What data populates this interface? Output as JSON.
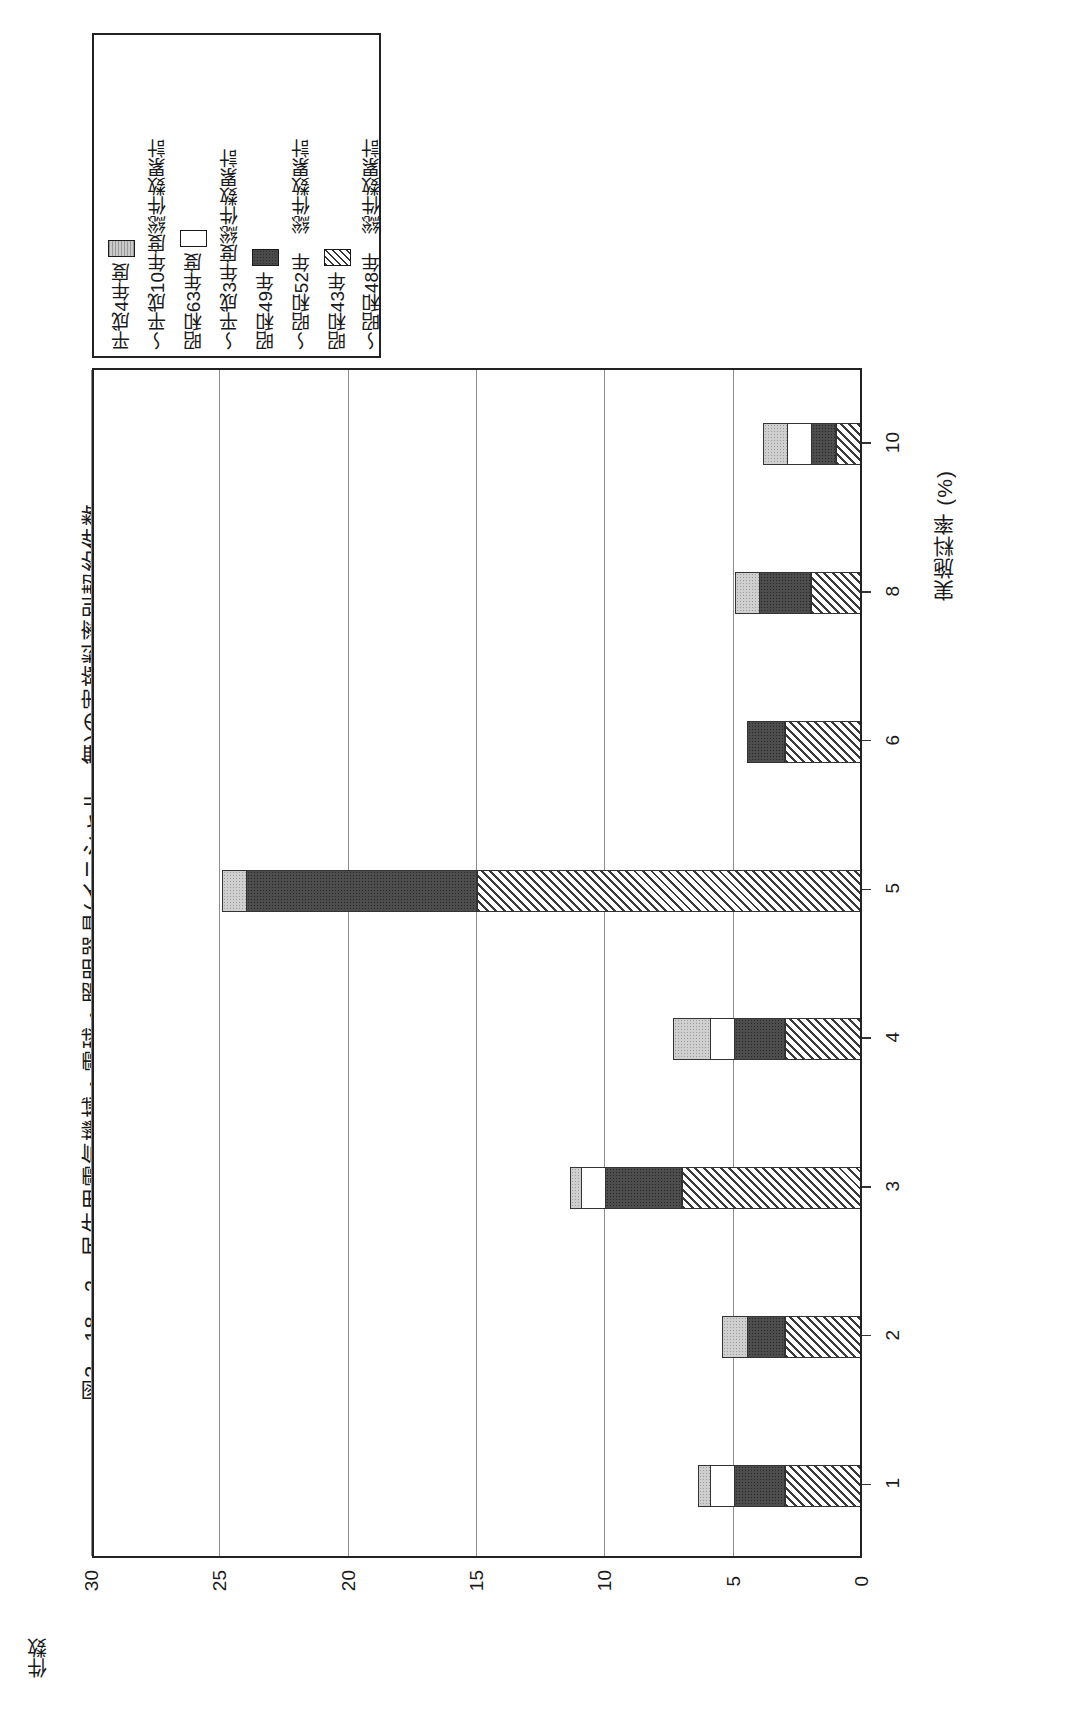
{
  "figure": {
    "title": "図2－18－2　民生用電気機械・電球・照明器具(イニシャル　無)の実施料率別契約件数",
    "value_axis_title": "件数",
    "category_axis_title": "実施料率 (%)"
  },
  "legend": {
    "entries": [
      {
        "label": "平成4年度",
        "swatch": "gray-dotted-swatch",
        "pattern": "gray"
      },
      {
        "label": "～平成10年度総件数累計",
        "swatch": "none-swatch",
        "pattern": "none"
      },
      {
        "label": "昭和63年度",
        "swatch": "white-swatch",
        "pattern": "white"
      },
      {
        "label": "～平成3年度総件数累計",
        "swatch": "none-swatch",
        "pattern": "none"
      },
      {
        "label": "昭和49年",
        "swatch": "dark-dotted-swatch",
        "pattern": "dark"
      },
      {
        "label": "～昭和52年　総件数累計",
        "swatch": "none-swatch",
        "pattern": "none"
      },
      {
        "label": "昭和43年",
        "swatch": "diagonal-hatch-swatch",
        "pattern": "hatch"
      },
      {
        "label": "～昭和48年　総件数累計",
        "swatch": "none-swatch",
        "pattern": "none"
      }
    ]
  },
  "chart_data": {
    "type": "bar",
    "orientation": "horizontal-stacked",
    "title": "図2－18－2　民生用電気機械・電球・照明器具(イニシャル　無)の実施料率別契約件数",
    "xlabel": "実施料率 (%)",
    "ylabel": "件数",
    "categories": [
      "1",
      "2",
      "3",
      "4",
      "5",
      "6",
      "8",
      "10"
    ],
    "value_ticks": [
      "0",
      "5",
      "10",
      "15",
      "20",
      "25",
      "30"
    ],
    "ylim": [
      0,
      30
    ],
    "grid": true,
    "legend_position": "top-left",
    "series": [
      {
        "name": "昭和43年～昭和48年 総件数累計",
        "pattern": "hatch",
        "values": [
          3,
          3,
          7,
          3,
          15,
          3,
          2,
          1
        ]
      },
      {
        "name": "昭和49年～昭和52年 総件数累計",
        "pattern": "dark",
        "values": [
          2,
          1.5,
          3,
          2,
          9,
          1.5,
          2,
          1
        ]
      },
      {
        "name": "昭和63年度～平成3年度総件数累計",
        "pattern": "white",
        "values": [
          1,
          0,
          1,
          1,
          0,
          0,
          0,
          1
        ]
      },
      {
        "name": "平成4年度～平成10年度総件数累計",
        "pattern": "gray",
        "values": [
          0.5,
          1,
          0.5,
          1.5,
          1,
          0,
          1,
          1
        ]
      }
    ],
    "totals": [
      6.5,
      5.5,
      11.5,
      7.5,
      25,
      4.5,
      5,
      4
    ]
  }
}
